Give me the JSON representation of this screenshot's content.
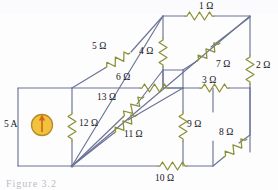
{
  "figure": {
    "kind": "circuit-schematic",
    "caption": "Figure 3.2",
    "colors": {
      "wire": "#6b7396",
      "resistor": "#8b8f35",
      "source_fill": "#f2c23c",
      "source_stroke": "#b8892a",
      "source_arrow": "#e0721a",
      "text": "#15161a",
      "background": "#fdfdfd"
    }
  },
  "source": {
    "name": "current-source",
    "label": "5 A",
    "symbol": "circle-with-up-arrow",
    "direction": "up"
  },
  "resistors": [
    {
      "id": "r1",
      "label": "1 Ω",
      "value": 1,
      "unit": "Ω",
      "edge": "top-back horizontal"
    },
    {
      "id": "r2",
      "label": "2 Ω",
      "value": 2,
      "unit": "Ω",
      "edge": "right-back vertical"
    },
    {
      "id": "r3",
      "label": "3 Ω",
      "value": 3,
      "unit": "Ω",
      "edge": "inner-right horizontal"
    },
    {
      "id": "r4",
      "label": "4 Ω",
      "value": 4,
      "unit": "Ω",
      "edge": "mid vertical"
    },
    {
      "id": "r5",
      "label": "5 Ω",
      "value": 5,
      "unit": "Ω",
      "edge": "top-left diagonal"
    },
    {
      "id": "r6",
      "label": "6 Ω",
      "value": 6,
      "unit": "Ω",
      "edge": "inner-left horizontal"
    },
    {
      "id": "r7",
      "label": "7 Ω",
      "value": 7,
      "unit": "Ω",
      "edge": "upper-right diagonal"
    },
    {
      "id": "r8",
      "label": "8 Ω",
      "value": 8,
      "unit": "Ω",
      "edge": "lower-right diagonal"
    },
    {
      "id": "r9",
      "label": "9 Ω",
      "value": 9,
      "unit": "Ω",
      "edge": "inner vertical"
    },
    {
      "id": "r10",
      "label": "10 Ω",
      "value": 10,
      "unit": "Ω",
      "edge": "bottom-front horizontal"
    },
    {
      "id": "r11",
      "label": "11 Ω",
      "value": 11,
      "unit": "Ω",
      "edge": "lower-left diagonal"
    },
    {
      "id": "r12",
      "label": "12 Ω",
      "value": 12,
      "unit": "Ω",
      "edge": "front-left vertical"
    },
    {
      "id": "r13",
      "label": "13 Ω",
      "value": 13,
      "unit": "Ω",
      "edge": "mid-left diagonal"
    }
  ]
}
